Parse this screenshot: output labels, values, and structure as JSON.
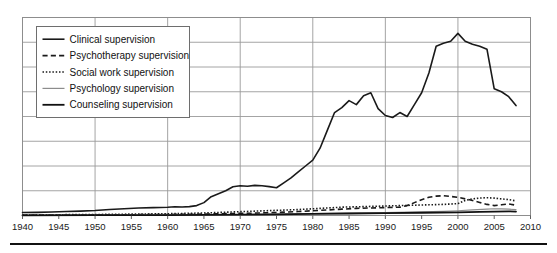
{
  "chart_data": {
    "type": "line",
    "title": "",
    "subtitle": "",
    "xlabel": "",
    "ylabel": "",
    "xlim": [
      1940,
      2010
    ],
    "ylim": [
      0,
      100
    ],
    "grid": true,
    "x_ticks": [
      1940,
      1945,
      1950,
      1955,
      1960,
      1965,
      1970,
      1975,
      1980,
      1985,
      1990,
      1995,
      2000,
      2005,
      2010
    ],
    "x_tick_labels": [
      "1940",
      "1945",
      "1950",
      "1955",
      "1960",
      "1965",
      "1970",
      "1975",
      "1980",
      "1985",
      "1990",
      "1995",
      "2000",
      "2005",
      "2010"
    ],
    "x_gridlines": [
      1940,
      1950,
      1960,
      1970,
      1980,
      1990,
      2000,
      2010
    ],
    "y_gridlines": [
      0,
      12.5,
      25,
      37.5,
      50,
      62.5,
      75,
      87.5,
      100
    ],
    "y_tick_labels": [],
    "legend_position": "upper-left",
    "series": [
      {
        "name": "Clinical supervision",
        "style": "solid",
        "color": "#1a1a1a",
        "width": 1.6,
        "x": [
          1940,
          1942,
          1944,
          1946,
          1948,
          1950,
          1952,
          1954,
          1956,
          1958,
          1960,
          1961,
          1962,
          1963,
          1964,
          1965,
          1966,
          1967,
          1968,
          1969,
          1970,
          1971,
          1972,
          1973,
          1974,
          1975,
          1976,
          1977,
          1978,
          1979,
          1980,
          1981,
          1982,
          1983,
          1984,
          1985,
          1986,
          1987,
          1988,
          1989,
          1990,
          1991,
          1992,
          1993,
          1994,
          1995,
          1996,
          1997,
          1998,
          1999,
          2000,
          2001,
          2002,
          2003,
          2004,
          2005,
          2006,
          2007,
          2008
        ],
        "y": [
          1.5,
          1.6,
          1.8,
          2.0,
          2.2,
          2.5,
          3.0,
          3.4,
          3.8,
          4.0,
          4.2,
          4.4,
          4.3,
          4.5,
          5.0,
          6.5,
          9.5,
          11.0,
          12.5,
          14.5,
          15.0,
          14.8,
          15.2,
          15.0,
          14.6,
          14.0,
          16.5,
          19.0,
          22.0,
          25.0,
          28.0,
          34.0,
          43.0,
          52.0,
          54.5,
          58.0,
          56.0,
          60.5,
          62.0,
          54.0,
          50.5,
          49.5,
          52.0,
          50.0,
          56.0,
          62.0,
          72.0,
          85.5,
          87.0,
          88.0,
          92.0,
          88.0,
          86.5,
          85.5,
          84.0,
          64.0,
          62.5,
          60.0,
          55.5
        ]
      },
      {
        "name": "Psychotherapy supervision",
        "style": "dashed",
        "color": "#1a1a1a",
        "width": 1.6,
        "x": [
          1940,
          1950,
          1955,
          1960,
          1963,
          1966,
          1969,
          1972,
          1975,
          1978,
          1980,
          1982,
          1984,
          1986,
          1988,
          1990,
          1992,
          1993,
          1994,
          1995,
          1996,
          1997,
          1998,
          1999,
          2000,
          2001,
          2002,
          2003,
          2004,
          2005,
          2006,
          2007,
          2008
        ],
        "y": [
          0.2,
          0.3,
          0.4,
          0.5,
          0.6,
          0.8,
          1.0,
          1.2,
          1.5,
          2.0,
          2.4,
          2.8,
          3.2,
          3.6,
          3.8,
          4.0,
          4.2,
          5.0,
          6.5,
          8.0,
          9.2,
          9.8,
          10.0,
          9.6,
          9.2,
          8.4,
          7.6,
          6.6,
          5.6,
          5.0,
          5.4,
          5.8,
          5.2
        ]
      },
      {
        "name": "Social work supervision",
        "style": "dotted",
        "color": "#1a1a1a",
        "width": 1.6,
        "x": [
          1940,
          1950,
          1955,
          1960,
          1963,
          1966,
          1969,
          1972,
          1975,
          1978,
          1980,
          1982,
          1984,
          1986,
          1988,
          1990,
          1992,
          1994,
          1996,
          1998,
          2000,
          2001,
          2002,
          2003,
          2004,
          2005,
          2006,
          2007,
          2008
        ],
        "y": [
          0.3,
          0.5,
          0.7,
          0.9,
          1.1,
          1.4,
          1.8,
          2.2,
          2.6,
          3.0,
          3.4,
          3.8,
          4.2,
          4.4,
          4.6,
          4.8,
          5.0,
          5.2,
          5.4,
          5.6,
          6.0,
          7.6,
          8.4,
          8.8,
          9.0,
          8.8,
          8.4,
          8.0,
          7.4
        ]
      },
      {
        "name": "Psychology supervision",
        "style": "solid",
        "color": "#8c8c8c",
        "width": 1.2,
        "x": [
          1940,
          1950,
          1960,
          1970,
          1975,
          1980,
          1985,
          1990,
          1995,
          1998,
          2000,
          2002,
          2004,
          2005,
          2006,
          2007,
          2008
        ],
        "y": [
          0.1,
          0.2,
          0.3,
          0.5,
          0.7,
          0.9,
          1.2,
          1.5,
          1.8,
          2.1,
          2.4,
          2.8,
          3.2,
          3.4,
          3.3,
          3.2,
          3.0
        ]
      },
      {
        "name": "Counseling supervision",
        "style": "solid",
        "color": "#111111",
        "width": 1.8,
        "x": [
          1940,
          1950,
          1960,
          1970,
          1975,
          1980,
          1985,
          1990,
          1995,
          2000,
          2003,
          2005,
          2007,
          2008
        ],
        "y": [
          0.1,
          0.15,
          0.2,
          0.4,
          0.6,
          0.8,
          1.0,
          1.2,
          1.4,
          1.6,
          1.8,
          2.0,
          2.1,
          2.0
        ]
      }
    ]
  },
  "legend": {
    "entries": [
      {
        "label": "Clinical supervision"
      },
      {
        "label": "Psychotherapy supervision"
      },
      {
        "label": "Social work supervision"
      },
      {
        "label": "Psychology supervision"
      },
      {
        "label": "Counseling supervision"
      }
    ]
  },
  "colors": {
    "grid": "#9a9a9a",
    "axis": "#4d4d4d",
    "text": "#1a1a1a",
    "background": "#ffffff",
    "rule": "#111111"
  }
}
